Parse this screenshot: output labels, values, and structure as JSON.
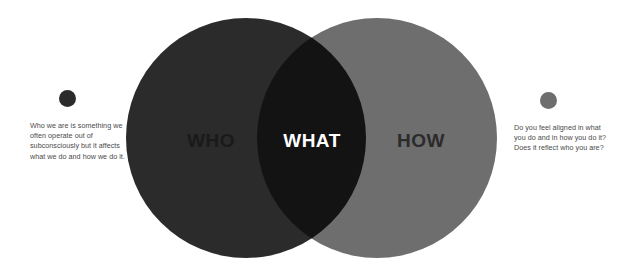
{
  "diagram": {
    "type": "venn",
    "background_color": "#ffffff",
    "circles": [
      {
        "id": "who",
        "label": "WHO",
        "fill_color": "#2b2b2b",
        "label_color": "#1a1a1a"
      },
      {
        "id": "how",
        "label": "HOW",
        "fill_color": "#6e6e6e",
        "label_color": "#2b2b2b"
      }
    ],
    "overlap": {
      "id": "what",
      "label": "WHAT",
      "fill_color": "#1c1c1c",
      "label_color": "#ffffff"
    },
    "annotations": [
      {
        "id": "who-note",
        "dot_color": "#2b2b2b",
        "text": "Who we are is something we often operate out of subconsciously but it affects what we do and how we do it."
      },
      {
        "id": "how-note",
        "dot_color": "#6e6e6e",
        "text": "Do you feel aligned in what you do and in how you do it? Does it reflect who you are?"
      }
    ]
  }
}
